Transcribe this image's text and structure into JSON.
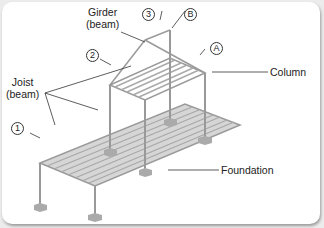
{
  "diagram": {
    "labels": {
      "girder": "Girder",
      "girder_sub": "(beam)",
      "joist": "Joist",
      "joist_sub": "(beam)",
      "column": "Column",
      "foundation": "Foundation"
    },
    "grid_markers": {
      "m1": "1",
      "m2": "2",
      "m3": "3",
      "mA": "A",
      "mB": "B"
    },
    "colors": {
      "frame": "#9a9a9a",
      "deck": "#d4d4d4",
      "leader": "#333333",
      "footing": "#a8a8a8"
    }
  }
}
